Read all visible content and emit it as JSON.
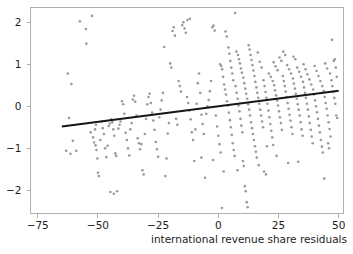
{
  "chart_data": {
    "type": "scatter",
    "title": "",
    "subtitle": "",
    "xlabel": "international revenue share residuals",
    "ylabel": "",
    "xlim": [
      -78,
      52
    ],
    "ylim": [
      -2.55,
      2.35
    ],
    "xticks": [
      -75,
      -50,
      -25,
      0,
      25,
      50
    ],
    "xticklabels": [
      "−75",
      "−50",
      "−25",
      "0",
      "25",
      "50"
    ],
    "yticks": [
      -2,
      -1,
      0,
      1,
      2
    ],
    "yticklabels": [
      "−2",
      "−1",
      "0",
      "1",
      "2"
    ],
    "grid": false,
    "legend": null,
    "point_color": "#9a9a9a",
    "point_size": 2.6,
    "fit_line": {
      "color": "#161616",
      "width": 2.1,
      "x_start": -65,
      "y_start": -0.48,
      "x_end": 50,
      "y_end": 0.37,
      "slope": 0.00739,
      "intercept": 0.0005
    },
    "frame_color": "#b0b0b0",
    "n_points": 304,
    "points": [
      [
        -62.5,
        0.78
      ],
      [
        -63.2,
        -1.06
      ],
      [
        -61.0,
        0.53
      ],
      [
        -62.0,
        -0.28
      ],
      [
        -60.4,
        -0.82
      ],
      [
        -61.4,
        -1.13
      ],
      [
        -59.0,
        -1.06
      ],
      [
        -57.5,
        2.02
      ],
      [
        -55.0,
        1.84
      ],
      [
        -54.8,
        1.49
      ],
      [
        -52.5,
        2.15
      ],
      [
        -53.0,
        -0.62
      ],
      [
        -52.0,
        -0.74
      ],
      [
        -51.6,
        -0.86
      ],
      [
        -51.0,
        -0.93
      ],
      [
        -50.6,
        -1.04
      ],
      [
        -50.2,
        -1.24
      ],
      [
        -50.0,
        -1.58
      ],
      [
        -49.6,
        -1.66
      ],
      [
        -51.2,
        -0.55
      ],
      [
        -50.8,
        -0.44
      ],
      [
        -49.0,
        -0.8
      ],
      [
        -48.4,
        -0.36
      ],
      [
        -48.0,
        -0.52
      ],
      [
        -47.5,
        -0.66
      ],
      [
        -47.0,
        -1.0
      ],
      [
        -46.5,
        -1.21
      ],
      [
        -46.0,
        -0.94
      ],
      [
        -45.5,
        -0.47
      ],
      [
        -45.0,
        -0.41
      ],
      [
        -44.5,
        -0.31
      ],
      [
        -44.0,
        -0.38
      ],
      [
        -43.6,
        -0.55
      ],
      [
        -43.2,
        -0.7
      ],
      [
        -42.8,
        -1.12
      ],
      [
        -42.4,
        -1.18
      ],
      [
        -44.8,
        -2.04
      ],
      [
        -43.4,
        -2.08
      ],
      [
        -42.0,
        -2.02
      ],
      [
        -41.5,
        -0.53
      ],
      [
        -41.0,
        -0.44
      ],
      [
        -40.6,
        -0.36
      ],
      [
        -40.0,
        0.12
      ],
      [
        -39.5,
        0.05
      ],
      [
        -39.0,
        -0.18
      ],
      [
        -38.5,
        -0.63
      ],
      [
        -38.0,
        -0.8
      ],
      [
        -37.5,
        -1.0
      ],
      [
        -37.0,
        -1.17
      ],
      [
        -36.5,
        -0.55
      ],
      [
        -36.0,
        -0.4
      ],
      [
        -35.5,
        0.16
      ],
      [
        -35.0,
        0.25
      ],
      [
        -34.5,
        0.11
      ],
      [
        -34.0,
        -0.22
      ],
      [
        -33.5,
        -0.76
      ],
      [
        -33.0,
        -0.88
      ],
      [
        -32.5,
        -1.02
      ],
      [
        -32.0,
        -0.9
      ],
      [
        -31.5,
        -1.52
      ],
      [
        -31.0,
        -1.62
      ],
      [
        -30.5,
        -0.66
      ],
      [
        -30.0,
        -0.3
      ],
      [
        -29.5,
        0.05
      ],
      [
        -29.0,
        0.22
      ],
      [
        -28.5,
        0.3
      ],
      [
        -28.0,
        0.08
      ],
      [
        -27.5,
        -0.15
      ],
      [
        -27.0,
        -0.34
      ],
      [
        -26.5,
        -0.56
      ],
      [
        -26.0,
        -0.85
      ],
      [
        -25.5,
        -1.02
      ],
      [
        -25.0,
        -1.2
      ],
      [
        -24.5,
        -0.26
      ],
      [
        -24.0,
        -0.08
      ],
      [
        -23.5,
        0.14
      ],
      [
        -23.0,
        0.32
      ],
      [
        -22.5,
        1.41
      ],
      [
        -22.0,
        -1.66
      ],
      [
        -21.5,
        -1.24
      ],
      [
        -21.0,
        -0.65
      ],
      [
        -20.5,
        -0.4
      ],
      [
        -20.0,
        1.02
      ],
      [
        -19.5,
        0.92
      ],
      [
        -19.0,
        1.79
      ],
      [
        -18.5,
        1.88
      ],
      [
        -18.0,
        1.68
      ],
      [
        -17.5,
        -0.3
      ],
      [
        -17.0,
        -0.44
      ],
      [
        -16.5,
        0.6
      ],
      [
        -16.0,
        0.48
      ],
      [
        -15.5,
        0.35
      ],
      [
        -15.0,
        1.93
      ],
      [
        -14.5,
        2.0
      ],
      [
        -14.0,
        1.85
      ],
      [
        -13.5,
        1.75
      ],
      [
        -13.0,
        0.22
      ],
      [
        -12.5,
        0.08
      ],
      [
        -12.0,
        -0.1
      ],
      [
        -11.5,
        -0.31
      ],
      [
        -11.0,
        -0.62
      ],
      [
        -12.8,
        2.05
      ],
      [
        -11.8,
        2.08
      ],
      [
        -10.5,
        -0.8
      ],
      [
        -10.0,
        -1.3
      ],
      [
        -9.5,
        -0.55
      ],
      [
        -9.0,
        0.06
      ],
      [
        -8.5,
        0.55
      ],
      [
        -8.0,
        0.78
      ],
      [
        -7.5,
        0.32
      ],
      [
        -7.0,
        -0.2
      ],
      [
        -6.5,
        -0.42
      ],
      [
        -6.0,
        -0.66
      ],
      [
        -5.5,
        -1.7
      ],
      [
        -5.0,
        -0.18
      ],
      [
        -4.5,
        0.0
      ],
      [
        -4.0,
        0.15
      ],
      [
        -3.5,
        0.36
      ],
      [
        -3.0,
        0.6
      ],
      [
        -2.5,
        1.88
      ],
      [
        -2.0,
        1.92
      ],
      [
        -1.5,
        1.8
      ],
      [
        -1.0,
        -0.22
      ],
      [
        -0.5,
        -0.48
      ],
      [
        0.0,
        -0.7
      ],
      [
        0.5,
        -0.9
      ],
      [
        1.0,
        -1.1
      ],
      [
        1.5,
        -2.42
      ],
      [
        0.8,
        1.0
      ],
      [
        1.2,
        0.96
      ],
      [
        1.6,
        0.88
      ],
      [
        2.0,
        0.7
      ],
      [
        2.4,
        0.52
      ],
      [
        2.8,
        0.4
      ],
      [
        3.2,
        0.28
      ],
      [
        3.6,
        0.12
      ],
      [
        4.0,
        0.02
      ],
      [
        4.4,
        -0.15
      ],
      [
        4.8,
        -0.33
      ],
      [
        5.2,
        -0.5
      ],
      [
        5.6,
        -0.68
      ],
      [
        6.0,
        -0.88
      ],
      [
        6.4,
        -1.04
      ],
      [
        6.8,
        -1.18
      ],
      [
        3.0,
        1.78
      ],
      [
        3.5,
        1.66
      ],
      [
        4.2,
        1.4
      ],
      [
        4.6,
        1.25
      ],
      [
        5.0,
        1.08
      ],
      [
        5.4,
        0.92
      ],
      [
        5.8,
        0.78
      ],
      [
        6.2,
        0.62
      ],
      [
        7.2,
        0.48
      ],
      [
        7.6,
        0.32
      ],
      [
        8.0,
        0.18
      ],
      [
        8.4,
        0.02
      ],
      [
        8.8,
        -0.12
      ],
      [
        9.2,
        -0.3
      ],
      [
        9.6,
        -0.46
      ],
      [
        10.0,
        -0.62
      ],
      [
        7.0,
        2.22
      ],
      [
        7.5,
        1.3
      ],
      [
        8.2,
        1.22
      ],
      [
        8.6,
        1.12
      ],
      [
        9.0,
        1.02
      ],
      [
        9.4,
        0.9
      ],
      [
        9.8,
        0.8
      ],
      [
        10.4,
        0.68
      ],
      [
        10.8,
        0.55
      ],
      [
        11.2,
        0.42
      ],
      [
        11.6,
        0.3
      ],
      [
        12.0,
        0.18
      ],
      [
        12.4,
        0.05
      ],
      [
        12.8,
        -0.08
      ],
      [
        13.2,
        -0.22
      ],
      [
        13.6,
        -0.38
      ],
      [
        10.2,
        -1.3
      ],
      [
        10.6,
        -1.42
      ],
      [
        11.0,
        -1.9
      ],
      [
        11.4,
        -2.02
      ],
      [
        11.8,
        -2.28
      ],
      [
        12.2,
        -2.4
      ],
      [
        14.0,
        -0.52
      ],
      [
        14.4,
        -0.66
      ],
      [
        14.8,
        -0.8
      ],
      [
        15.2,
        -0.95
      ],
      [
        15.6,
        -1.08
      ],
      [
        16.0,
        -1.22
      ],
      [
        12.6,
        1.45
      ],
      [
        13.0,
        1.35
      ],
      [
        13.4,
        1.22
      ],
      [
        13.8,
        1.1
      ],
      [
        14.2,
        0.98
      ],
      [
        14.6,
        0.85
      ],
      [
        15.0,
        0.72
      ],
      [
        15.4,
        0.58
      ],
      [
        15.8,
        0.45
      ],
      [
        16.2,
        0.32
      ],
      [
        16.6,
        0.2
      ],
      [
        17.0,
        0.06
      ],
      [
        17.4,
        -0.08
      ],
      [
        17.8,
        -0.22
      ],
      [
        18.2,
        -0.36
      ],
      [
        18.6,
        -0.5
      ],
      [
        16.4,
        1.28
      ],
      [
        17.2,
        1.06
      ],
      [
        18.0,
        0.92
      ],
      [
        18.8,
        0.62
      ],
      [
        19.2,
        0.48
      ],
      [
        19.6,
        0.34
      ],
      [
        20.0,
        0.2
      ],
      [
        20.4,
        0.06
      ],
      [
        20.8,
        -0.1
      ],
      [
        21.2,
        -0.26
      ],
      [
        21.6,
        -0.42
      ],
      [
        22.0,
        -0.58
      ],
      [
        22.4,
        -0.74
      ],
      [
        22.8,
        -0.92
      ],
      [
        19.0,
        -1.55
      ],
      [
        19.8,
        -1.62
      ],
      [
        21.0,
        0.78
      ],
      [
        21.8,
        0.7
      ],
      [
        22.6,
        0.6
      ],
      [
        23.2,
        0.5
      ],
      [
        23.6,
        0.38
      ],
      [
        24.0,
        0.26
      ],
      [
        24.4,
        0.14
      ],
      [
        24.8,
        0.02
      ],
      [
        25.2,
        -0.12
      ],
      [
        25.6,
        -0.26
      ],
      [
        26.0,
        -0.4
      ],
      [
        26.4,
        -0.56
      ],
      [
        23.0,
        1.05
      ],
      [
        23.8,
        0.95
      ],
      [
        24.6,
        0.86
      ],
      [
        25.4,
        1.16
      ],
      [
        26.2,
        1.08
      ],
      [
        26.8,
        0.72
      ],
      [
        27.2,
        0.6
      ],
      [
        27.6,
        0.48
      ],
      [
        28.0,
        0.35
      ],
      [
        28.4,
        0.22
      ],
      [
        28.8,
        0.08
      ],
      [
        29.2,
        -0.06
      ],
      [
        29.6,
        -0.2
      ],
      [
        30.0,
        -0.34
      ],
      [
        30.4,
        -0.5
      ],
      [
        30.8,
        -0.66
      ],
      [
        27.0,
        1.3
      ],
      [
        27.8,
        1.22
      ],
      [
        28.6,
        0.98
      ],
      [
        29.4,
        0.88
      ],
      [
        30.2,
        0.78
      ],
      [
        31.0,
        0.66
      ],
      [
        31.4,
        0.54
      ],
      [
        31.8,
        0.42
      ],
      [
        32.2,
        0.3
      ],
      [
        32.6,
        0.18
      ],
      [
        33.0,
        0.05
      ],
      [
        33.4,
        -0.08
      ],
      [
        33.8,
        -0.22
      ],
      [
        34.2,
        -0.38
      ],
      [
        34.6,
        -0.55
      ],
      [
        35.0,
        -0.7
      ],
      [
        31.2,
        1.18
      ],
      [
        32.0,
        1.12
      ],
      [
        32.8,
        0.92
      ],
      [
        33.6,
        0.82
      ],
      [
        34.4,
        0.7
      ],
      [
        35.2,
        0.58
      ],
      [
        35.6,
        0.45
      ],
      [
        36.0,
        0.32
      ],
      [
        36.4,
        0.2
      ],
      [
        36.8,
        0.06
      ],
      [
        37.2,
        -0.08
      ],
      [
        37.6,
        -0.24
      ],
      [
        38.0,
        -0.4
      ],
      [
        38.4,
        -0.56
      ],
      [
        38.8,
        -0.72
      ],
      [
        39.2,
        -0.88
      ],
      [
        35.4,
        1.0
      ],
      [
        36.2,
        0.88
      ],
      [
        37.0,
        0.76
      ],
      [
        37.8,
        0.64
      ],
      [
        38.6,
        0.52
      ],
      [
        39.4,
        0.4
      ],
      [
        39.8,
        0.28
      ],
      [
        40.2,
        0.14
      ],
      [
        40.6,
        0.0
      ],
      [
        41.0,
        -0.14
      ],
      [
        41.4,
        -0.3
      ],
      [
        41.8,
        -0.46
      ],
      [
        42.2,
        -0.62
      ],
      [
        42.6,
        -0.8
      ],
      [
        43.0,
        -0.96
      ],
      [
        43.4,
        -1.1
      ],
      [
        40.0,
        0.96
      ],
      [
        40.8,
        0.84
      ],
      [
        41.6,
        0.72
      ],
      [
        42.4,
        0.6
      ],
      [
        43.2,
        0.48
      ],
      [
        43.8,
        0.36
      ],
      [
        44.2,
        0.22
      ],
      [
        44.6,
        0.08
      ],
      [
        45.0,
        -0.06
      ],
      [
        45.4,
        -0.22
      ],
      [
        45.8,
        -0.38
      ],
      [
        46.2,
        -0.54
      ],
      [
        46.6,
        -0.72
      ],
      [
        44.0,
        -1.72
      ],
      [
        45.6,
        -0.88
      ],
      [
        46.0,
        -1.0
      ],
      [
        44.4,
        1.02
      ],
      [
        45.2,
        0.9
      ],
      [
        46.4,
        0.78
      ],
      [
        47.0,
        0.62
      ],
      [
        47.4,
        0.48
      ],
      [
        47.8,
        0.34
      ],
      [
        48.2,
        0.2
      ],
      [
        48.6,
        0.06
      ],
      [
        47.2,
        1.58
      ],
      [
        48.0,
        1.08
      ],
      [
        48.4,
        1.12
      ],
      [
        48.8,
        0.92
      ],
      [
        49.0,
        -0.22
      ],
      [
        49.4,
        -0.28
      ],
      [
        49.2,
        0.7
      ],
      [
        33.2,
        -1.32
      ],
      [
        29.0,
        -1.35
      ],
      [
        24.2,
        -1.18
      ],
      [
        20.2,
        -0.95
      ],
      [
        16.8,
        -1.4
      ],
      [
        8.0,
        -1.52
      ],
      [
        2.2,
        -1.55
      ],
      [
        -2.2,
        -1.28
      ],
      [
        -7.0,
        -1.22
      ]
    ]
  },
  "axis_label": {
    "x_title": "international revenue share residuals"
  }
}
